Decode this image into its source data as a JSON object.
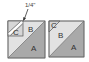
{
  "figure": {
    "measurement_label": "1/4\"",
    "left_block": {
      "labels": {
        "a": "A",
        "b": "B",
        "c": "C"
      }
    },
    "right_block": {
      "labels": {
        "a": "A",
        "b": "B",
        "c": "C"
      }
    }
  },
  "colors": {
    "a_fill": "#a9a9a9",
    "b_fill": "#e2e2e2",
    "c_fill": "#d6d6d6",
    "outline": "#666666"
  }
}
